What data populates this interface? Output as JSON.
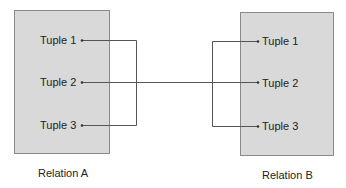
{
  "relation_a": {
    "label": "Relation A",
    "tuples": [
      "Tuple 1",
      "Tuple 2",
      "Tuple 3"
    ]
  },
  "relation_b": {
    "label": "Relation B",
    "tuples": [
      "Tuple 1",
      "Tuple 2",
      "Tuple 3"
    ]
  },
  "connections": [
    {
      "from": "A.Tuple 1",
      "to": "A.Tuple 3"
    },
    {
      "from": "A.Tuple 2",
      "to": "B.Tuple 2"
    },
    {
      "from": "B.Tuple 1",
      "to": "B.Tuple 3"
    }
  ],
  "colors": {
    "box_fill": "#d9d9d9",
    "box_border": "#8a8a8a",
    "line": "#555555"
  }
}
